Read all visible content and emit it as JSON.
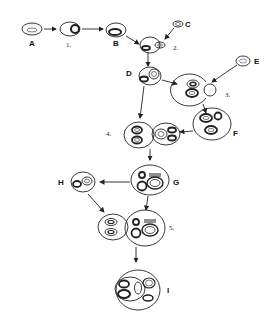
{
  "diagram": {
    "stages": [
      {
        "id": "A",
        "label": "A"
      },
      {
        "id": "B",
        "label": "B"
      },
      {
        "id": "C",
        "label": "C"
      },
      {
        "id": "D",
        "label": "D"
      },
      {
        "id": "E",
        "label": "E"
      },
      {
        "id": "F",
        "label": "F"
      },
      {
        "id": "G",
        "label": "G"
      },
      {
        "id": "H",
        "label": "H"
      },
      {
        "id": "I",
        "label": "I"
      }
    ],
    "steps": [
      {
        "id": "1",
        "label": "1."
      },
      {
        "id": "2",
        "label": "2."
      },
      {
        "id": "3",
        "label": "3."
      },
      {
        "id": "4",
        "label": "4."
      },
      {
        "id": "5",
        "label": "5."
      }
    ],
    "colors": {
      "stroke": "#222222",
      "background": "#ffffff"
    }
  }
}
